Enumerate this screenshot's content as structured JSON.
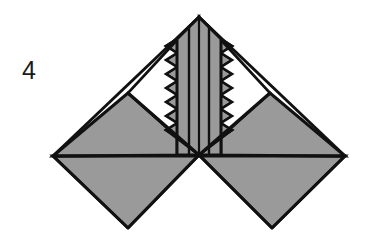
{
  "figure": {
    "label": "4",
    "caption_number": "4",
    "background_color": "#ffffff",
    "stroke_color": "#111111",
    "fill_gray": "#9a9a9a",
    "fill_white": "#ffffff",
    "canvas": {
      "width": 372,
      "height": 245
    },
    "geometry": {
      "apex": [
        199,
        17
      ],
      "center": [
        199,
        155
      ],
      "left_vertex": [
        53,
        156
      ],
      "right_vertex": [
        345,
        156
      ],
      "bottom_left_vertex": [
        128,
        228
      ],
      "bottom_right_vertex": [
        272,
        228
      ],
      "left_shoulder": [
        128,
        93
      ],
      "right_shoulder": [
        270,
        93
      ],
      "band_half_width": 22,
      "inner_line_offsets": [
        6,
        10
      ],
      "zigzag_top_y": 38,
      "zigzag_bottom_y": 132,
      "zigzag_teeth": 7,
      "zigzag_amplitude": 11,
      "stroke_width_outer": 3,
      "stroke_width_inner": 2.2
    },
    "elements": [
      {
        "name": "left-lower-diamond-half",
        "fill": "#9a9a9a"
      },
      {
        "name": "right-lower-diamond-half",
        "fill": "#9a9a9a"
      },
      {
        "name": "left-upper-wing-triangle",
        "fill": "#9a9a9a"
      },
      {
        "name": "right-upper-wing-triangle",
        "fill": "#9a9a9a"
      },
      {
        "name": "left-white-notch",
        "fill": "#ffffff"
      },
      {
        "name": "right-white-notch",
        "fill": "#ffffff"
      },
      {
        "name": "central-vertical-band",
        "fill": "#9a9a9a"
      },
      {
        "name": "central-inner-stripe-left",
        "fill": "#111111"
      },
      {
        "name": "central-inner-stripe-right",
        "fill": "#111111"
      }
    ]
  }
}
